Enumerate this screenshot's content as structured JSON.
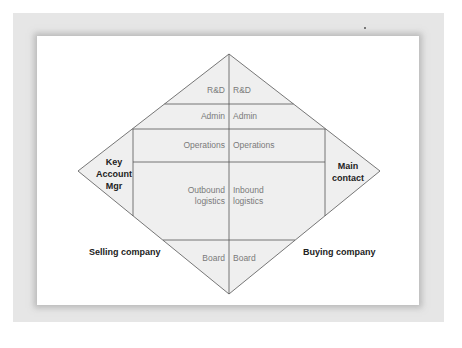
{
  "diagram": {
    "title": "",
    "fill_color": "#efefef",
    "line_color": "#555555",
    "rows": [
      {
        "id": "rd",
        "left": "R&D",
        "right": "R&D"
      },
      {
        "id": "admin",
        "left": "Admin",
        "right": "Admin"
      },
      {
        "id": "operations",
        "left": "Operations",
        "right": "Operations"
      },
      {
        "id": "logistics",
        "left_line1": "Outbound",
        "left_line2": "logistics",
        "right_line1": "Inbound",
        "right_line2": "logistics"
      },
      {
        "id": "board",
        "left": "Board",
        "right": "Board"
      }
    ],
    "left_role": {
      "line1": "Key",
      "line2": "Account",
      "line3": "Mgr"
    },
    "right_role": {
      "line1": "Main",
      "line2": "contact"
    },
    "selling_label": "Selling company",
    "buying_label": "Buying company"
  }
}
